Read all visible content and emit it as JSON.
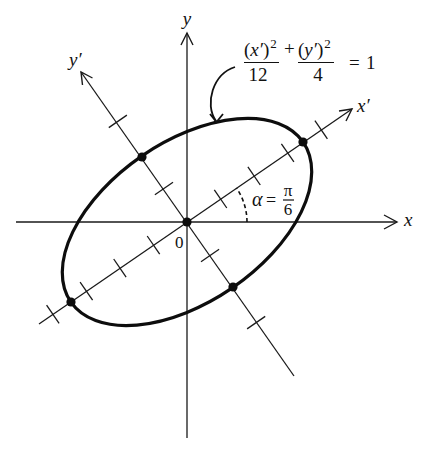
{
  "figure": {
    "axes": {
      "x_label": "x",
      "y_label": "y",
      "x_prime_label": "x′",
      "y_prime_label": "y′",
      "origin_label": "0"
    },
    "equation": {
      "num1_open": "(",
      "num1_var": "x′",
      "num1_close": ")",
      "num1_exp": "2",
      "plus": "+",
      "num2_open": "(",
      "num2_var": "y′",
      "num2_close": ")",
      "num2_exp": "2",
      "den1": "12",
      "den2": "4",
      "equals": "=",
      "rhs": "1"
    },
    "angle_label": {
      "symbol": "α",
      "equals": "=",
      "numerator": "π",
      "denominator": "6"
    },
    "ellipse": {
      "a_squared": 12,
      "b_squared": 4,
      "rotation_angle": "π/6"
    },
    "ticks": {
      "x_prime": [
        -4,
        -3,
        -2,
        -1,
        1,
        2,
        3,
        4
      ],
      "y_prime": [
        -3,
        -1,
        1,
        3
      ]
    },
    "marked_points": [
      "origin",
      "positive x′ vertex",
      "negative x′ vertex",
      "positive y′ vertex",
      "negative y′ vertex"
    ]
  },
  "colors": {
    "ink": "#111111",
    "background": "#ffffff"
  }
}
